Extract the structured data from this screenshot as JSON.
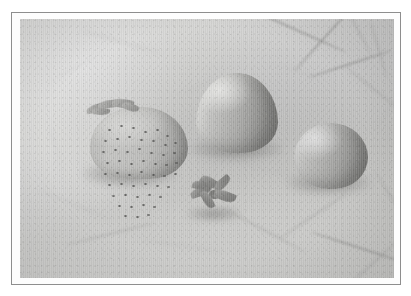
{
  "image": {
    "kind": "photograph",
    "rendering": "grayscale",
    "caption": "Three strawberries and one detached calyx arranged on a pale marble surface",
    "frame": {
      "outer_background_color": "#ffffff",
      "border_color": "#8e8e8e",
      "mat_color": "#fdfdfd"
    },
    "background": {
      "name": "marble-surface",
      "description": "pale grey marble or stone slab with faint darker veining, strongest in the upper-right and lower-right corners",
      "base_color": "#cecece",
      "highlight_color": "#dedede",
      "shadow_color": "#b4b4b2",
      "vein_color": "#878785"
    },
    "artifacts": {
      "scanlines": "fine vertical scan striping across the whole photo",
      "grain": "film/scan grain speckle",
      "vignette": "slight darkening toward the photo edges"
    },
    "subjects": [
      {
        "name": "strawberry-seeded",
        "label": "Strawberry with visible seeds and calyx",
        "position": "left",
        "surface": "textured, covered in dark achene dots",
        "has_calyx": true,
        "tone_light": "#c4c4c2",
        "tone_dark": "#8e8e8c"
      },
      {
        "name": "strawberry-conical",
        "label": "Smooth conical strawberry",
        "position": "center-upper",
        "surface": "smooth, hulled, no visible seeds",
        "has_calyx": false,
        "tone_light": "#d2d2d0",
        "tone_dark": "#7e7e7c"
      },
      {
        "name": "strawberry-round",
        "label": "Rounded strawberry",
        "position": "right",
        "surface": "smooth and rounded",
        "has_calyx": false,
        "tone_light": "#c9c9c7",
        "tone_dark": "#7d7d7b"
      },
      {
        "name": "calyx-detached",
        "label": "Detached strawberry calyx (star-shaped hull)",
        "position": "center-lower",
        "surface": "dark, five-pointed leafy star",
        "tone_light": "#a2a2a0",
        "tone_dark": "#767674"
      }
    ],
    "veins": [
      {
        "x": 212,
        "y": 8,
        "w": 120,
        "h": 2.2,
        "rot": 24,
        "class": "vein"
      },
      {
        "x": 258,
        "y": 16,
        "w": 96,
        "h": 1.8,
        "rot": -48,
        "class": "vein"
      },
      {
        "x": 300,
        "y": 4,
        "w": 70,
        "h": 1.6,
        "rot": 62,
        "class": "vein soft"
      },
      {
        "x": 286,
        "y": 44,
        "w": 88,
        "h": 1.9,
        "rot": -18,
        "class": "vein"
      },
      {
        "x": 330,
        "y": 30,
        "w": 58,
        "h": 1.5,
        "rot": 74,
        "class": "vein soft"
      },
      {
        "x": 248,
        "y": 52,
        "w": 62,
        "h": 1.4,
        "rot": 12,
        "class": "vein faint"
      },
      {
        "x": 318,
        "y": 70,
        "w": 74,
        "h": 1.7,
        "rot": 38,
        "class": "vein soft"
      },
      {
        "x": 340,
        "y": 96,
        "w": 50,
        "h": 1.4,
        "rot": -62,
        "class": "vein faint"
      },
      {
        "x": 60,
        "y": 22,
        "w": 84,
        "h": 1.5,
        "rot": 16,
        "class": "vein faint"
      },
      {
        "x": 24,
        "y": 48,
        "w": 64,
        "h": 1.3,
        "rot": -28,
        "class": "vein faint"
      },
      {
        "x": 8,
        "y": 126,
        "w": 54,
        "h": 1.3,
        "rot": 70,
        "class": "vein faint"
      },
      {
        "x": 14,
        "y": 184,
        "w": 78,
        "h": 1.5,
        "rot": 22,
        "class": "vein faint"
      },
      {
        "x": 44,
        "y": 214,
        "w": 92,
        "h": 1.6,
        "rot": -14,
        "class": "vein soft"
      },
      {
        "x": 120,
        "y": 226,
        "w": 86,
        "h": 1.5,
        "rot": 8,
        "class": "vein faint"
      },
      {
        "x": 196,
        "y": 210,
        "w": 96,
        "h": 1.7,
        "rot": 28,
        "class": "vein soft"
      },
      {
        "x": 252,
        "y": 196,
        "w": 82,
        "h": 1.6,
        "rot": -34,
        "class": "vein soft"
      },
      {
        "x": 288,
        "y": 228,
        "w": 104,
        "h": 1.9,
        "rot": 18,
        "class": "vein"
      },
      {
        "x": 316,
        "y": 244,
        "w": 72,
        "h": 1.5,
        "rot": -42,
        "class": "vein soft"
      },
      {
        "x": 340,
        "y": 180,
        "w": 66,
        "h": 1.5,
        "rot": 58,
        "class": "vein soft"
      },
      {
        "x": 296,
        "y": 160,
        "w": 58,
        "h": 1.3,
        "rot": -8,
        "class": "vein faint"
      },
      {
        "x": 150,
        "y": 66,
        "w": 60,
        "h": 1.3,
        "rot": -22,
        "class": "vein faint"
      },
      {
        "x": 210,
        "y": 150,
        "w": 70,
        "h": 1.4,
        "rot": 14,
        "class": "vein faint"
      }
    ],
    "seeds": [
      [
        18,
        22
      ],
      [
        30,
        18
      ],
      [
        42,
        20
      ],
      [
        54,
        24
      ],
      [
        66,
        22
      ],
      [
        76,
        28
      ],
      [
        14,
        33
      ],
      [
        26,
        31
      ],
      [
        38,
        29
      ],
      [
        50,
        32
      ],
      [
        62,
        33
      ],
      [
        74,
        37
      ],
      [
        84,
        35
      ],
      [
        12,
        44
      ],
      [
        24,
        42
      ],
      [
        36,
        44
      ],
      [
        48,
        41
      ],
      [
        60,
        45
      ],
      [
        72,
        47
      ],
      [
        83,
        45
      ],
      [
        16,
        55
      ],
      [
        28,
        53
      ],
      [
        40,
        56
      ],
      [
        52,
        53
      ],
      [
        64,
        56
      ],
      [
        75,
        57
      ],
      [
        85,
        55
      ],
      [
        14,
        66
      ],
      [
        26,
        65
      ],
      [
        38,
        67
      ],
      [
        50,
        64
      ],
      [
        62,
        67
      ],
      [
        73,
        68
      ],
      [
        84,
        66
      ],
      [
        18,
        77
      ],
      [
        30,
        76
      ],
      [
        42,
        78
      ],
      [
        54,
        76
      ],
      [
        66,
        78
      ],
      [
        77,
        79
      ],
      [
        22,
        88
      ],
      [
        34,
        87
      ],
      [
        46,
        89
      ],
      [
        58,
        87
      ],
      [
        69,
        89
      ],
      [
        28,
        98
      ],
      [
        40,
        99
      ],
      [
        52,
        97
      ],
      [
        63,
        99
      ],
      [
        34,
        108
      ],
      [
        46,
        109
      ],
      [
        57,
        107
      ]
    ],
    "attached_calyx_leaves": [
      {
        "x": 2,
        "y": 6,
        "w": 22,
        "h": 8,
        "rot": -14
      },
      {
        "x": 14,
        "y": 2,
        "w": 24,
        "h": 8,
        "rot": -4
      },
      {
        "x": 28,
        "y": 1,
        "w": 22,
        "h": 9,
        "rot": 10
      },
      {
        "x": 38,
        "y": 5,
        "w": 17,
        "h": 8,
        "rot": 26
      },
      {
        "x": 8,
        "y": 10,
        "w": 18,
        "h": 7,
        "rot": 6
      }
    ],
    "detached_calyx_sepals": [
      {
        "x": 0,
        "y": 10,
        "w": 22,
        "h": 9,
        "rot": -18
      },
      {
        "x": 10,
        "y": 0,
        "w": 18,
        "h": 10,
        "rot": 34
      },
      {
        "x": 22,
        "y": 2,
        "w": 20,
        "h": 9,
        "rot": -40
      },
      {
        "x": 24,
        "y": 14,
        "w": 22,
        "h": 10,
        "rot": 22
      },
      {
        "x": 8,
        "y": 18,
        "w": 19,
        "h": 9,
        "rot": 64
      },
      {
        "x": 2,
        "y": 4,
        "w": 14,
        "h": 8,
        "rot": 8
      }
    ]
  }
}
